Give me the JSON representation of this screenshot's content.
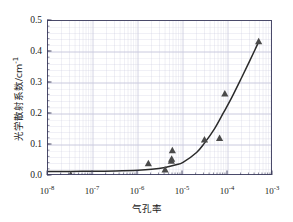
{
  "chart_data": {
    "type": "scatter",
    "title": "",
    "xlabel": "气孔率",
    "ylabel": "光学散射系数/cm⁻¹",
    "ylabel_main": "光学散射系数/cm",
    "ylabel_sup": "-1",
    "xscale": "log",
    "yscale": "linear",
    "xlim": [
      1e-08,
      0.001
    ],
    "ylim": [
      0.0,
      0.5
    ],
    "grid": "minor-log-grid-on",
    "legend": "none",
    "marker": "triangle",
    "marker_color": "#4a4a4a",
    "line_color": "#2b2b2b",
    "frame_color": "#4a4a6a",
    "grid_color": "#c9c9dd",
    "xticks": [
      {
        "label_base": "10",
        "label_exp": "-8",
        "value": 1e-08
      },
      {
        "label_base": "10",
        "label_exp": "-7",
        "value": 1e-07
      },
      {
        "label_base": "10",
        "label_exp": "-6",
        "value": 1e-06
      },
      {
        "label_base": "10",
        "label_exp": "-5",
        "value": 1e-05
      },
      {
        "label_base": "10",
        "label_exp": "-4",
        "value": 0.0001
      },
      {
        "label_base": "10",
        "label_exp": "-3",
        "value": 0.001
      }
    ],
    "yticks": [
      {
        "label": "0.0",
        "value": 0.0
      },
      {
        "label": "0.1",
        "value": 0.1
      },
      {
        "label": "0.2",
        "value": 0.2
      },
      {
        "label": "0.3",
        "value": 0.3
      },
      {
        "label": "0.4",
        "value": 0.4
      },
      {
        "label": "0.5",
        "value": 0.5
      }
    ],
    "points": [
      {
        "x": 3.2e-08,
        "y": 0.004
      },
      {
        "x": 1.7e-06,
        "y": 0.04
      },
      {
        "x": 4e-06,
        "y": 0.02
      },
      {
        "x": 5.5e-06,
        "y": 0.048
      },
      {
        "x": 5.6e-06,
        "y": 0.055
      },
      {
        "x": 5.8e-06,
        "y": 0.082
      },
      {
        "x": 3e-05,
        "y": 0.117
      },
      {
        "x": 6.5e-05,
        "y": 0.122
      },
      {
        "x": 8.5e-05,
        "y": 0.265
      },
      {
        "x": 0.00048,
        "y": 0.434
      }
    ],
    "fit_curve": [
      {
        "x": 1e-08,
        "y": 0.0145
      },
      {
        "x": 3.2e-08,
        "y": 0.0148
      },
      {
        "x": 1e-07,
        "y": 0.0153
      },
      {
        "x": 3.2e-07,
        "y": 0.0163
      },
      {
        "x": 1e-06,
        "y": 0.0185
      },
      {
        "x": 2e-06,
        "y": 0.0215
      },
      {
        "x": 4e-06,
        "y": 0.0275
      },
      {
        "x": 7e-06,
        "y": 0.036
      },
      {
        "x": 1e-05,
        "y": 0.044
      },
      {
        "x": 2e-05,
        "y": 0.076
      },
      {
        "x": 3e-05,
        "y": 0.106
      },
      {
        "x": 5e-05,
        "y": 0.152
      },
      {
        "x": 8e-05,
        "y": 0.205
      },
      {
        "x": 0.00012,
        "y": 0.252
      },
      {
        "x": 0.0002,
        "y": 0.317
      },
      {
        "x": 0.0003,
        "y": 0.37
      },
      {
        "x": 0.0004,
        "y": 0.408
      },
      {
        "x": 0.00048,
        "y": 0.433
      }
    ]
  }
}
